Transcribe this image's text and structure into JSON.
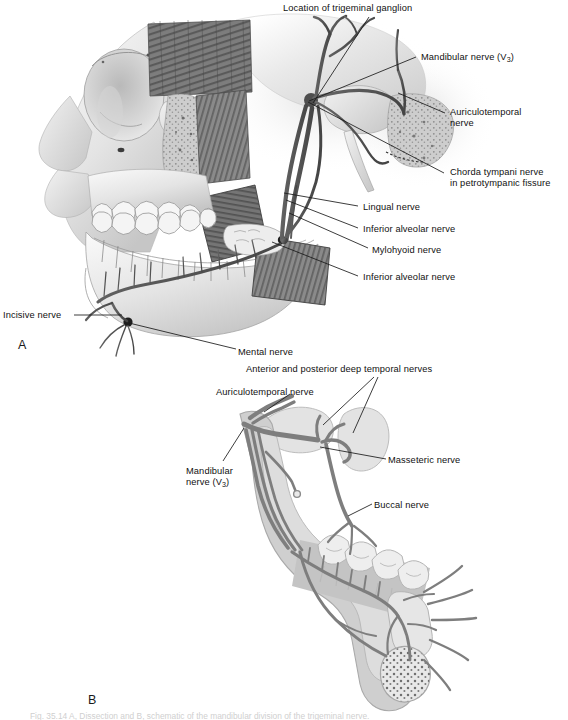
{
  "figure": {
    "panel_a_letter": "A",
    "panel_b_letter": "B",
    "caption": "Fig. 35.14 A, Dissection and B, schematic of the mandibular division of the trigeminal nerve."
  },
  "colors": {
    "bone_light": "#ececec",
    "bone_mid": "#d2d2d2",
    "bone_shadow": "#b0b0b0",
    "muscle_dark": "#6e6e6e",
    "muscle_mid": "#8a8a8a",
    "nerve_dark": "#4a4a4a",
    "nerve_mid": "#7a7a7a",
    "tooth": "#f4f4f4",
    "leader_line": "#1a1a1a",
    "text": "#111111",
    "background": "#ffffff"
  },
  "panel_a": {
    "name": "Dissection of mandibular nerve",
    "labels": [
      {
        "id": "trigeminal-ganglion",
        "text": "Location of trigeminal ganglion",
        "x": 283,
        "y": 3,
        "align": "left"
      },
      {
        "id": "mandibular-nerve",
        "text": "Mandibular nerve (V3)",
        "x": 421,
        "y": 52,
        "align": "left"
      },
      {
        "id": "auriculotemporal-nerve",
        "text": "Auriculotemporal\nnerve",
        "x": 450,
        "y": 107,
        "align": "left"
      },
      {
        "id": "chorda-tympani-nerve",
        "text": "Chorda tympani nerve\nin petrotympanic fissure",
        "x": 450,
        "y": 167,
        "align": "left"
      },
      {
        "id": "lingual-nerve",
        "text": "Lingual nerve",
        "x": 363,
        "y": 202,
        "align": "left"
      },
      {
        "id": "inferior-alveolar-nerve-upper",
        "text": "Inferior alveolar nerve",
        "x": 363,
        "y": 224,
        "align": "left"
      },
      {
        "id": "mylohyoid-nerve",
        "text": "Mylohyoid nerve",
        "x": 372,
        "y": 245,
        "align": "left"
      },
      {
        "id": "inferior-alveolar-nerve-lower",
        "text": "Inferior alveolar nerve",
        "x": 363,
        "y": 272,
        "align": "left"
      },
      {
        "id": "incisive-nerve",
        "text": "Incisive nerve",
        "x": 3,
        "y": 310,
        "align": "left"
      },
      {
        "id": "mental-nerve",
        "text": "Mental nerve",
        "x": 238,
        "y": 347,
        "align": "left"
      }
    ],
    "leaders": [
      {
        "id": "leader-trigeminal-ganglion",
        "x1": 313,
        "y1": 103,
        "x2": 369,
        "y2": 17
      },
      {
        "id": "leader-mandibular-nerve",
        "x1": 309,
        "y1": 101,
        "x2": 416,
        "y2": 57
      },
      {
        "id": "leader-auriculotemporal-nerve",
        "x1": 398,
        "y1": 93,
        "x2": 445,
        "y2": 113
      },
      {
        "id": "leader-chorda-tympani-nerve",
        "x1": 308,
        "y1": 102,
        "x2": 444,
        "y2": 173
      },
      {
        "id": "leader-lingual-nerve",
        "x1": 284,
        "y1": 193,
        "x2": 358,
        "y2": 206
      },
      {
        "id": "leader-inferior-alveolar-upper",
        "x1": 286,
        "y1": 200,
        "x2": 358,
        "y2": 228
      },
      {
        "id": "leader-mylohyoid-nerve",
        "x1": 289,
        "y1": 213,
        "x2": 368,
        "y2": 248
      },
      {
        "id": "leader-inferior-alveolar-lower",
        "x1": 272,
        "y1": 242,
        "x2": 358,
        "y2": 276
      },
      {
        "id": "leader-incisive-nerve",
        "x1": 74,
        "y1": 315,
        "x2": 122,
        "y2": 315
      },
      {
        "id": "leader-mental-nerve",
        "x1": 129,
        "y1": 323,
        "x2": 236,
        "y2": 349
      }
    ]
  },
  "panel_b": {
    "name": "Schematic of mandibular nerve branches",
    "labels": [
      {
        "id": "deep-temporal-nerves",
        "text": "Anterior and posterior deep temporal nerves",
        "x": 246,
        "y": 364,
        "align": "left"
      },
      {
        "id": "auriculotemporal-nerve-b",
        "text": "Auriculotemporal nerve",
        "x": 216,
        "y": 387,
        "align": "left"
      },
      {
        "id": "masseteric-nerve",
        "text": "Masseteric nerve",
        "x": 388,
        "y": 455,
        "align": "left"
      },
      {
        "id": "mandibular-nerve-b",
        "text": "Mandibular\nnerve (V3)",
        "x": 186,
        "y": 466,
        "align": "left"
      },
      {
        "id": "buccal-nerve",
        "text": "Buccal nerve",
        "x": 374,
        "y": 500,
        "align": "left"
      }
    ],
    "leaders": [
      {
        "id": "leader-deep-temporal-1",
        "x1": 323,
        "y1": 425,
        "x2": 374,
        "y2": 377
      },
      {
        "id": "leader-deep-temporal-2",
        "x1": 353,
        "y1": 433,
        "x2": 378,
        "y2": 377
      },
      {
        "id": "leader-auriculotemporal-b",
        "x1": 264,
        "y1": 412,
        "x2": 290,
        "y2": 394
      },
      {
        "id": "leader-masseteric-nerve",
        "x1": 320,
        "y1": 447,
        "x2": 386,
        "y2": 459
      },
      {
        "id": "leader-mandibular-b",
        "x1": 244,
        "y1": 428,
        "x2": 223,
        "y2": 461
      },
      {
        "id": "leader-buccal-nerve",
        "x1": 348,
        "y1": 516,
        "x2": 372,
        "y2": 504
      }
    ]
  }
}
